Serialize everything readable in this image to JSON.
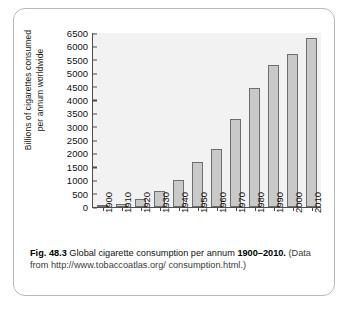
{
  "figure": {
    "number_label": "Fig. 48.3",
    "title_text": "Global cigarette consumption per annum",
    "year_range": "1900–2010.",
    "source_line1": "(Data from http://www.tobaccoatlas.org/",
    "source_line2": "consumption.html.)"
  },
  "axis": {
    "ylabel_line1": "Billions of cigarettes consumed",
    "ylabel_line2": "per annum worldwide"
  },
  "chart_data": {
    "type": "bar",
    "title": "Global cigarette consumption per annum 1900–2010",
    "xlabel": "",
    "ylabel": "Billions of cigarettes consumed per annum worldwide",
    "categories": [
      "1900",
      "1910",
      "1920",
      "1930",
      "1940",
      "1950",
      "1960",
      "1970",
      "1980",
      "1990",
      "2000",
      "2010"
    ],
    "values": [
      50,
      120,
      310,
      600,
      1000,
      1680,
      2150,
      3280,
      4450,
      5320,
      5700,
      6300
    ],
    "ylim": [
      0,
      6500
    ],
    "ytick_labels": [
      "0",
      "500",
      "1000",
      "1500",
      "2000",
      "2500",
      "3000",
      "3500",
      "4000",
      "4500",
      "5000",
      "5500",
      "6000",
      "6500"
    ],
    "ytick_values": [
      0,
      500,
      1000,
      1500,
      2000,
      2500,
      3000,
      3500,
      4000,
      4500,
      5000,
      5500,
      6000,
      6500
    ],
    "grid": false,
    "legend": "none",
    "bar_fill": "#c9c9c9",
    "bar_stroke": "#6e6e6e",
    "plot_background": "#f2f2f2"
  }
}
